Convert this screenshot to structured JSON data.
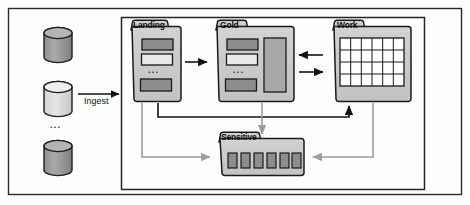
{
  "diagram": {
    "title_text": "",
    "outer_frame": {
      "name": "outer-frame"
    },
    "inner_frame": {
      "name": "data-lake-zone-frame"
    },
    "sources": {
      "label_dots": "...",
      "items": [
        {
          "name": "source-database-1",
          "fill": "#9a9a9a"
        },
        {
          "name": "source-database-2",
          "fill": "#d9d9d9"
        },
        {
          "name": "source-database-3",
          "fill": "#9a9a9a"
        }
      ]
    },
    "ingest": {
      "label": "Ingest",
      "arrow_name": "ingest-arrow"
    },
    "folders": [
      {
        "id": "landing",
        "label": "Landing",
        "dots": "...",
        "blocks": [
          {
            "fill": "#8d8d8d"
          },
          {
            "fill": "#e8e8e8"
          },
          {
            "fill": "#8d8d8d"
          }
        ]
      },
      {
        "id": "gold",
        "label": "Gold",
        "dots": "...",
        "blocks": [
          {
            "fill": "#8d8d8d"
          },
          {
            "fill": "#e8e8e8"
          },
          {
            "fill": "#8d8d8d"
          }
        ],
        "tall_block": {
          "fill": "#a8a8a8"
        }
      },
      {
        "id": "work",
        "label": "Work",
        "grid": {
          "cols": 6,
          "rows": 4,
          "fill": "#ffffff"
        }
      },
      {
        "id": "sensitive",
        "label": "Sensitive",
        "cells": 6,
        "cell_fill": "#8d8d8d"
      }
    ],
    "connections": [
      {
        "name": "landing-to-gold-arrow",
        "style": "solid-dark",
        "from": "landing",
        "to": "gold"
      },
      {
        "name": "work-to-gold-arrow",
        "style": "solid-dark",
        "from": "work",
        "to": "gold"
      },
      {
        "name": "gold-to-work-arrow",
        "style": "solid-dark",
        "from": "gold",
        "to": "work"
      },
      {
        "name": "landing-to-work-arrow",
        "style": "solid-dark",
        "from": "landing",
        "to": "work"
      },
      {
        "name": "landing-to-sensitive-arrow",
        "style": "solid-gray",
        "from": "landing",
        "to": "sensitive"
      },
      {
        "name": "gold-to-sensitive-arrow",
        "style": "solid-gray",
        "from": "gold",
        "to": "sensitive"
      },
      {
        "name": "work-to-sensitive-arrow",
        "style": "solid-gray",
        "from": "work",
        "to": "sensitive"
      }
    ],
    "colors": {
      "folder_fill": "#c9c9c9",
      "folder_stroke": "#1a1a1a",
      "frame_stroke": "#2b2b2b",
      "arrow_dark": "#121212",
      "arrow_gray": "#9d9d9d",
      "page_bg": "#fdfdfc"
    }
  }
}
